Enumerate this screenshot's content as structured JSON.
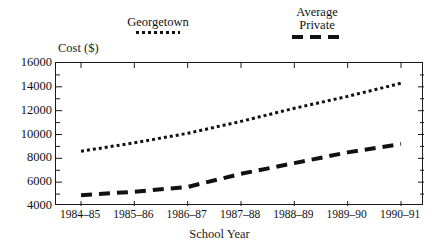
{
  "chart_data": {
    "type": "line",
    "title": "",
    "xlabel": "School Year",
    "ylabel": "Cost ($)",
    "categories": [
      "1984–85",
      "1985–86",
      "1986–87",
      "1987–88",
      "1988–89",
      "1989–90",
      "1990–91"
    ],
    "ylim": [
      4000,
      16000
    ],
    "ytick_values": [
      4000,
      6000,
      8000,
      10000,
      12000,
      14000,
      16000
    ],
    "ytick_labels": [
      "4000",
      "6000",
      "8000",
      "10000",
      "12000",
      "14000",
      "16000"
    ],
    "yminor_step": 1000,
    "grid": false,
    "legend_position": "above-plot",
    "series": [
      {
        "name": "Georgetown",
        "style": "dotted",
        "color": "#111111",
        "values": [
          8600,
          9300,
          10100,
          11100,
          12200,
          13200,
          14300
        ]
      },
      {
        "name": "Average Private",
        "style": "dashed",
        "color": "#111111",
        "values": [
          4900,
          5200,
          5600,
          6700,
          7600,
          8500,
          9200
        ]
      }
    ]
  },
  "legend": {
    "entries": [
      {
        "label": "Georgetown",
        "label_line2": ""
      },
      {
        "label": "Average",
        "label_line2": "Private"
      }
    ]
  },
  "axes": {
    "y_title": "Cost ($)",
    "x_title": "School Year"
  }
}
